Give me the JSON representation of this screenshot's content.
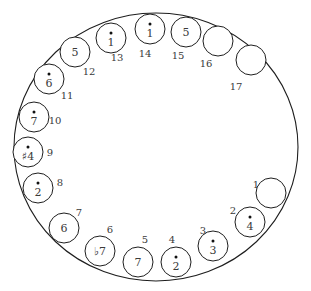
{
  "diagram": {
    "type": "circular-arrangement",
    "outer_ellipse": {
      "cx": 156,
      "cy": 147,
      "rx": 142,
      "ry": 134
    },
    "slot_radius": 15,
    "slots": [
      {
        "position": "1",
        "note": "",
        "dotted": false,
        "cx": 271,
        "cy": 193,
        "lx": 256,
        "ly": 188
      },
      {
        "position": "2",
        "note": "4",
        "dotted": true,
        "cx": 250,
        "cy": 222,
        "lx": 233,
        "ly": 214
      },
      {
        "position": "3",
        "note": "3",
        "dotted": true,
        "cx": 213,
        "cy": 246,
        "lx": 203,
        "ly": 234
      },
      {
        "position": "4",
        "note": "2",
        "dotted": true,
        "cx": 176,
        "cy": 262,
        "lx": 172,
        "ly": 243
      },
      {
        "position": "5",
        "note": "7",
        "dotted": false,
        "cx": 138,
        "cy": 262,
        "lx": 145,
        "ly": 243
      },
      {
        "position": "6",
        "note": "♭7",
        "dotted": false,
        "cx": 100,
        "cy": 251,
        "lx": 110,
        "ly": 233
      },
      {
        "position": "7",
        "note": "6",
        "dotted": false,
        "cx": 64,
        "cy": 228,
        "lx": 79,
        "ly": 216
      },
      {
        "position": "8",
        "note": "2",
        "dotted": true,
        "cx": 38,
        "cy": 188,
        "lx": 60,
        "ly": 186
      },
      {
        "position": "9",
        "note": "♯4",
        "dotted": true,
        "cx": 28,
        "cy": 152,
        "lx": 50,
        "ly": 156
      },
      {
        "position": "10",
        "note": "7",
        "dotted": true,
        "cx": 34,
        "cy": 117,
        "lx": 55,
        "ly": 124
      },
      {
        "position": "11",
        "note": "6",
        "dotted": true,
        "cx": 49,
        "cy": 79,
        "lx": 67,
        "ly": 99
      },
      {
        "position": "12",
        "note": "5",
        "dotted": false,
        "cx": 75,
        "cy": 52,
        "lx": 89,
        "ly": 75
      },
      {
        "position": "13",
        "note": "1",
        "dotted": true,
        "cx": 111,
        "cy": 38,
        "lx": 117,
        "ly": 61
      },
      {
        "position": "14",
        "note": "1",
        "dotted": true,
        "cx": 150,
        "cy": 29,
        "lx": 145,
        "ly": 57
      },
      {
        "position": "15",
        "note": "5",
        "dotted": false,
        "cx": 186,
        "cy": 32,
        "lx": 178,
        "ly": 59
      },
      {
        "position": "16",
        "note": "",
        "dotted": false,
        "cx": 218,
        "cy": 41,
        "lx": 206,
        "ly": 67
      },
      {
        "position": "17",
        "note": "",
        "dotted": false,
        "cx": 251,
        "cy": 60,
        "lx": 236,
        "ly": 90
      }
    ]
  }
}
